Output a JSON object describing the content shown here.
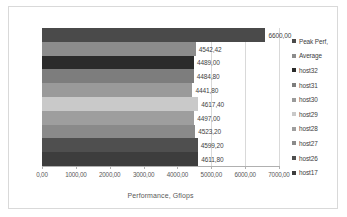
{
  "chart_data": {
    "type": "bar",
    "orientation": "horizontal",
    "title": "",
    "xlabel": "Performance, Gflops",
    "ylabel": "",
    "xlim": [
      0,
      7000
    ],
    "xticks": [
      "0,00",
      "1000,00",
      "2000,00",
      "3000,00",
      "4000,00",
      "5000,00",
      "6000,00",
      "7000,00"
    ],
    "xtick_values": [
      0,
      1000,
      2000,
      3000,
      4000,
      5000,
      6000,
      7000
    ],
    "grid": true,
    "legend_position": "right",
    "categories": [
      "Peak Perf,",
      "Average",
      "host32",
      "host31",
      "host30",
      "host29",
      "host28",
      "host27",
      "host26",
      "host17"
    ],
    "values": [
      6600.0,
      4542.42,
      4489.0,
      4484.8,
      4441.8,
      4617.4,
      4497.0,
      4523.2,
      4599.2,
      4611.8
    ],
    "data_labels": [
      "6600,00",
      "4542,42",
      "4489,00",
      "4484,80",
      "4441,80",
      "4617,40",
      "4497,00",
      "4523,20",
      "4599,20",
      "4611,80"
    ],
    "colors": [
      "#4a4a4a",
      "#8c8c8c",
      "#2b2b2b",
      "#7d7d7d",
      "#9a9a9a",
      "#c9c9c9",
      "#9e9e9e",
      "#8a8a8a",
      "#4f4f4f",
      "#3d3d3d"
    ]
  },
  "legend": {
    "items": [
      {
        "label": "Peak Perf,",
        "color": "#4a4a4a"
      },
      {
        "label": "Average",
        "color": "#8c8c8c"
      },
      {
        "label": "host32",
        "color": "#2b2b2b"
      },
      {
        "label": "host31",
        "color": "#7d7d7d"
      },
      {
        "label": "host30",
        "color": "#9a9a9a"
      },
      {
        "label": "host29",
        "color": "#c9c9c9"
      },
      {
        "label": "host28",
        "color": "#9e9e9e"
      },
      {
        "label": "host27",
        "color": "#8a8a8a"
      },
      {
        "label": "host26",
        "color": "#4f4f4f"
      },
      {
        "label": "host17",
        "color": "#3d3d3d"
      }
    ]
  }
}
